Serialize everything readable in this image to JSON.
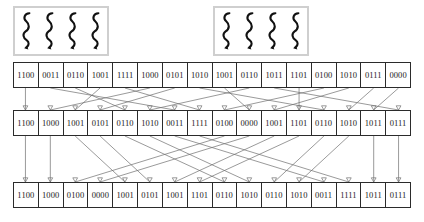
{
  "diagram": {
    "line_color": "#6e6e6e",
    "arrow_color": "#2b2b2b",
    "cell_border_color": "#2b2b2b",
    "box_border_color": "#cfcfcf",
    "text_color": "#1a1a1a"
  },
  "squiggle_boxes": [
    {
      "name": "left-squiggle-box",
      "count": 4,
      "x": 13,
      "y": 6,
      "width": 96,
      "height": 50
    },
    {
      "name": "right-squiggle-box",
      "count": 4,
      "x": 213,
      "y": 6,
      "width": 96,
      "height": 50
    }
  ],
  "rows": [
    {
      "name": "row-top",
      "x": 13,
      "y": 62,
      "width": 398,
      "height": 26,
      "cells": [
        "1100",
        "0011",
        "0110",
        "1001",
        "1111",
        "1000",
        "0101",
        "1010",
        "1001",
        "0110",
        "1011",
        "1101",
        "0100",
        "1010",
        "0111",
        "0000"
      ]
    },
    {
      "name": "row-middle",
      "x": 13,
      "y": 110,
      "width": 398,
      "height": 26,
      "cells": [
        "1100",
        "1000",
        "1001",
        "0101",
        "0110",
        "1010",
        "0011",
        "1111",
        "0100",
        "0000",
        "1001",
        "1101",
        "0110",
        "1010",
        "1011",
        "0111"
      ]
    },
    {
      "name": "row-bottom",
      "x": 13,
      "y": 182,
      "width": 398,
      "height": 26,
      "cells": [
        "1100",
        "1000",
        "0100",
        "0000",
        "1001",
        "0101",
        "1001",
        "1101",
        "0110",
        "1010",
        "0110",
        "1010",
        "0011",
        "1111",
        "1011",
        "0111"
      ]
    }
  ],
  "permutations": {
    "top_to_middle": [
      0,
      5,
      3,
      6,
      2,
      9,
      1,
      4,
      12,
      8,
      13,
      11,
      7,
      14,
      15,
      10
    ],
    "middle_to_bottom": [
      0,
      1,
      8,
      9,
      2,
      3,
      10,
      11,
      4,
      5,
      12,
      13,
      6,
      7,
      14,
      15
    ]
  }
}
